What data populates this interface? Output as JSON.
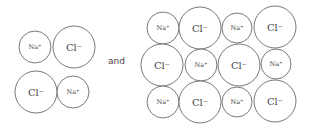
{
  "connector_text": "and",
  "labels": {
    "sodium": "Na⁺",
    "chloride": "Cl⁻"
  },
  "left_group": {
    "ions": [
      {
        "type": "sodium",
        "label": "Na⁺",
        "cx": 35,
        "cy": 47,
        "r": 16
      },
      {
        "type": "chloride",
        "label": "Cl⁻",
        "cx": 74,
        "cy": 47,
        "r": 21
      },
      {
        "type": "chloride",
        "label": "Cl⁻",
        "cx": 36,
        "cy": 92,
        "r": 21
      },
      {
        "type": "sodium",
        "label": "Na⁺",
        "cx": 73,
        "cy": 92,
        "r": 16
      }
    ]
  },
  "right_group": {
    "rows": [
      [
        "Na⁺",
        "Cl⁻",
        "Na⁺",
        "Cl⁻"
      ],
      [
        "Cl⁻",
        "Na⁺",
        "Cl⁻",
        "Na⁺"
      ],
      [
        "Na⁺",
        "Cl⁻",
        "Na⁺",
        "Cl⁻"
      ]
    ],
    "ions": [
      {
        "type": "sodium",
        "label": "Na⁺",
        "cx": 163,
        "cy": 28,
        "r": 16
      },
      {
        "type": "chloride",
        "label": "Cl⁻",
        "cx": 200,
        "cy": 28,
        "r": 21
      },
      {
        "type": "sodium",
        "label": "Na⁺",
        "cx": 237,
        "cy": 28,
        "r": 15
      },
      {
        "type": "chloride",
        "label": "Cl⁻",
        "cx": 275,
        "cy": 27,
        "r": 21
      },
      {
        "type": "chloride",
        "label": "Cl⁻",
        "cx": 162,
        "cy": 65,
        "r": 21
      },
      {
        "type": "sodium",
        "label": "Na⁺",
        "cx": 201,
        "cy": 65,
        "r": 16
      },
      {
        "type": "chloride",
        "label": "Cl⁻",
        "cx": 239,
        "cy": 65,
        "r": 21
      },
      {
        "type": "sodium",
        "label": "Na⁺",
        "cx": 276,
        "cy": 64,
        "r": 15
      },
      {
        "type": "sodium",
        "label": "Na⁺",
        "cx": 163,
        "cy": 102,
        "r": 16
      },
      {
        "type": "chloride",
        "label": "Cl⁻",
        "cx": 200,
        "cy": 102,
        "r": 21
      },
      {
        "type": "sodium",
        "label": "Na⁺",
        "cx": 237,
        "cy": 102,
        "r": 15
      },
      {
        "type": "chloride",
        "label": "Cl⁻",
        "cx": 275,
        "cy": 101,
        "r": 21
      }
    ]
  }
}
